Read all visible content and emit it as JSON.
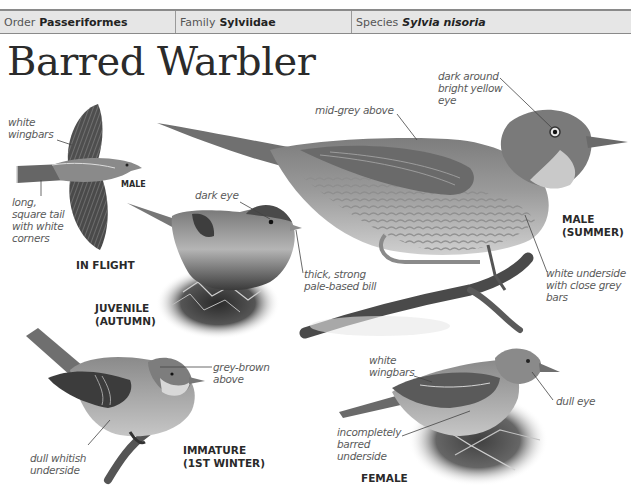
{
  "header": {
    "order_label": "Order",
    "order_value": "Passeriformes",
    "family_label": "Family",
    "family_value": "Sylviidae",
    "species_label": "Species",
    "species_value": "Sylvia nisoria"
  },
  "title": "Barred Warbler",
  "figures": {
    "in_flight": {
      "caption": "IN FLIGHT",
      "sex_tag": "MALE",
      "notes": {
        "wingbars": [
          "white",
          "wingbars"
        ],
        "tail": [
          "long,",
          "square tail",
          "with white",
          "corners"
        ]
      }
    },
    "juvenile": {
      "caption": [
        "JUVENILE",
        "(AUTUMN)"
      ],
      "notes": {
        "eye": "dark eye",
        "bill": [
          "thick, strong",
          "pale-based bill"
        ]
      }
    },
    "male_summer": {
      "caption": [
        "MALE",
        "(SUMMER)"
      ],
      "notes": {
        "upperparts": "mid-grey above",
        "eye": [
          "dark around",
          "bright yellow",
          "eye"
        ],
        "underside": [
          "white underside",
          "with close grey",
          "bars"
        ]
      }
    },
    "immature": {
      "caption": [
        "IMMATURE",
        "(1ST WINTER)"
      ],
      "notes": {
        "upperparts": [
          "grey-brown",
          "above"
        ],
        "underside": [
          "dull whitish",
          "underside"
        ]
      }
    },
    "female": {
      "caption": "FEMALE",
      "notes": {
        "wingbars": [
          "white",
          "wingbars"
        ],
        "eye": "dull eye",
        "underside": [
          "incompletely",
          "barred",
          "underside"
        ]
      }
    }
  }
}
